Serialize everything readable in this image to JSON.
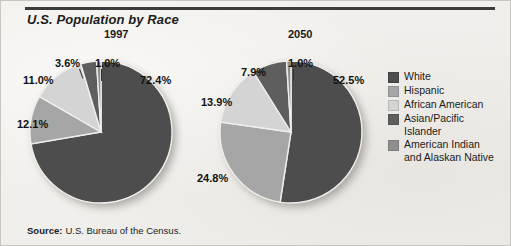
{
  "title": "U.S. Population by Race",
  "source": {
    "label": "Source:",
    "text": "U.S. Bureau of the Census."
  },
  "legend": {
    "items": [
      {
        "label": "White",
        "color": "#4d4d4d"
      },
      {
        "label": "Hispanic",
        "color": "#a6a6a6"
      },
      {
        "label": "African American",
        "color": "#d4d4d4"
      },
      {
        "label": "Asian/Pacific\nIslander",
        "color": "#5e5e5e"
      },
      {
        "label": "American Indian\nand Alaskan Native",
        "color": "#8f8f8f"
      }
    ]
  },
  "chart_data": [
    {
      "type": "pie",
      "title": "1997",
      "categories": [
        "White",
        "Hispanic",
        "African American",
        "Asian/Pacific Islander",
        "American Indian and Alaskan Native"
      ],
      "values": [
        72.4,
        11.0,
        12.1,
        3.6,
        1.0
      ],
      "labels": [
        "72.4%",
        "11.0%",
        "12.1%",
        "3.6%",
        "1.0%"
      ],
      "colors": [
        "#4d4d4d",
        "#a6a6a6",
        "#d4d4d4",
        "#5e5e5e",
        "#8f8f8f"
      ],
      "unit": "percent"
    },
    {
      "type": "pie",
      "title": "2050",
      "categories": [
        "White",
        "Hispanic",
        "African American",
        "Asian/Pacific Islander",
        "American Indian and Alaskan Native"
      ],
      "values": [
        52.5,
        24.8,
        13.9,
        7.9,
        1.0
      ],
      "labels": [
        "52.5%",
        "24.8%",
        "13.9%",
        "7.9%",
        "1.0%"
      ],
      "colors": [
        "#4d4d4d",
        "#a6a6a6",
        "#d4d4d4",
        "#5e5e5e",
        "#8f8f8f"
      ],
      "unit": "percent"
    }
  ]
}
